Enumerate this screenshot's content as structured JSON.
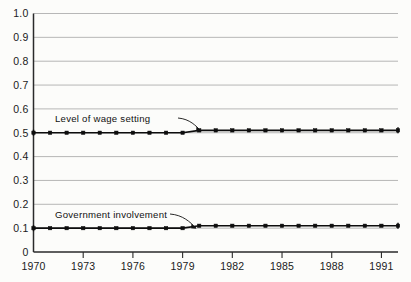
{
  "chart_data": {
    "type": "line",
    "title": "",
    "subtitle": "",
    "xlabel": "",
    "ylabel": "",
    "xlim": [
      1970,
      1992
    ],
    "ylim": [
      0,
      1.0
    ],
    "grid": "horizontal",
    "legend_position": "inline-annotations",
    "x": [
      1970,
      1971,
      1972,
      1973,
      1974,
      1975,
      1976,
      1977,
      1978,
      1979,
      1980,
      1981,
      1982,
      1983,
      1984,
      1985,
      1986,
      1987,
      1988,
      1989,
      1990,
      1991,
      1992
    ],
    "xtick_labels": [
      "1970",
      "1973",
      "1976",
      "1979",
      "1982",
      "1985",
      "1988",
      "1991"
    ],
    "xtick_values": [
      1970,
      1973,
      1976,
      1979,
      1982,
      1985,
      1988,
      1991
    ],
    "ytick_labels": [
      "0",
      "0.1",
      "0.2",
      "0.3",
      "0.4",
      "0.5",
      "0.6",
      "0.7",
      "0.8",
      "0.9",
      "1.0"
    ],
    "ytick_values": [
      0,
      0.1,
      0.2,
      0.3,
      0.4,
      0.5,
      0.6,
      0.7,
      0.8,
      0.9,
      1.0
    ],
    "series": [
      {
        "name": "Level of wage setting",
        "values": [
          0.5,
          0.5,
          0.5,
          0.5,
          0.5,
          0.5,
          0.5,
          0.5,
          0.5,
          0.5,
          0.51,
          0.51,
          0.51,
          0.51,
          0.51,
          0.51,
          0.51,
          0.51,
          0.51,
          0.51,
          0.51,
          0.51,
          0.51
        ]
      },
      {
        "name": "Government involvement",
        "values": [
          0.1,
          0.1,
          0.1,
          0.1,
          0.1,
          0.1,
          0.1,
          0.1,
          0.1,
          0.1,
          0.11,
          0.11,
          0.11,
          0.11,
          0.11,
          0.11,
          0.11,
          0.11,
          0.11,
          0.11,
          0.11,
          0.11,
          0.11
        ]
      }
    ],
    "annotations": [
      {
        "text": "Level of wage setting",
        "points_to_x": 1979,
        "points_to_y": 0.5
      },
      {
        "text": "Government involvement",
        "points_to_x": 1979,
        "points_to_y": 0.1
      }
    ]
  },
  "axes": {
    "y_ticks": [
      {
        "label": "1.0",
        "value": 1.0
      },
      {
        "label": "0.9",
        "value": 0.9
      },
      {
        "label": "0.8",
        "value": 0.8
      },
      {
        "label": "0.7",
        "value": 0.7
      },
      {
        "label": "0.6",
        "value": 0.6
      },
      {
        "label": "0.5",
        "value": 0.5
      },
      {
        "label": "0.4",
        "value": 0.4
      },
      {
        "label": "0.3",
        "value": 0.3
      },
      {
        "label": "0.2",
        "value": 0.2
      },
      {
        "label": "0.1",
        "value": 0.1
      },
      {
        "label": "0",
        "value": 0.0
      }
    ],
    "x_ticks": [
      {
        "label": "1970",
        "value": 1970
      },
      {
        "label": "1973",
        "value": 1973
      },
      {
        "label": "1976",
        "value": 1976
      },
      {
        "label": "1979",
        "value": 1979
      },
      {
        "label": "1982",
        "value": 1982
      },
      {
        "label": "1985",
        "value": 1985
      },
      {
        "label": "1988",
        "value": 1988
      },
      {
        "label": "1991",
        "value": 1991
      }
    ]
  },
  "annotations": {
    "wage_label": "Level of wage setting",
    "government_label": "Government involvement"
  },
  "colors": {
    "background": "#fcfcfa",
    "grid": "#9a9a9a",
    "axis": "#2a2a2a",
    "series": "#0d0d0d",
    "text": "#1a1a1a"
  }
}
